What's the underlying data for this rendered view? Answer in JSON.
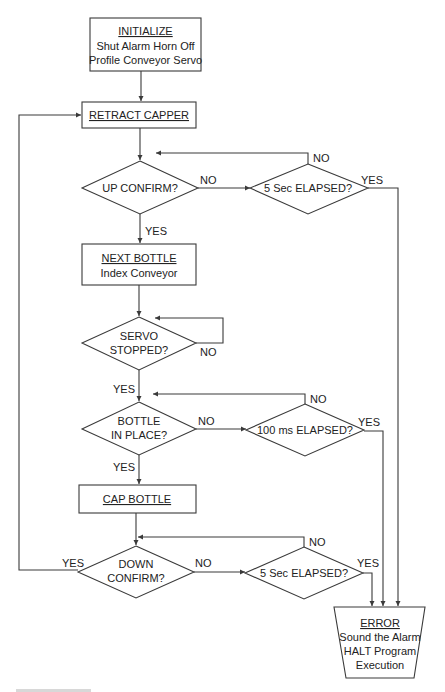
{
  "flowchart": {
    "initialize": {
      "title": "INITIALIZE",
      "lines": [
        "Shut Alarm Horn Off",
        "Profile Conveyor Servo"
      ]
    },
    "retract": {
      "title": "RETRACT CAPPER"
    },
    "up_confirm": {
      "text": "UP CONFIRM?",
      "no": "NO",
      "yes": "YES"
    },
    "up_timeout": {
      "text": "5 Sec ELAPSED?",
      "no": "NO",
      "yes": "YES"
    },
    "next_bottle": {
      "title": "NEXT BOTTLE",
      "lines": [
        "Index Conveyor"
      ]
    },
    "servo": {
      "lines": [
        "SERVO",
        "STOPPED?"
      ],
      "no": "NO",
      "yes": "YES"
    },
    "bottle_in_place": {
      "lines": [
        "BOTTLE",
        "IN PLACE?"
      ],
      "no": "NO",
      "yes": "YES"
    },
    "bottle_timeout": {
      "text": "100 ms ELAPSED?",
      "no": "NO",
      "yes": "YES"
    },
    "cap_bottle": {
      "title": "CAP BOTTLE"
    },
    "down_confirm": {
      "lines": [
        "DOWN",
        "CONFIRM?"
      ],
      "no": "NO",
      "yes": "YES"
    },
    "down_timeout": {
      "text": "5 Sec ELAPSED?",
      "no": "NO",
      "yes": "YES"
    },
    "error": {
      "title": "ERROR",
      "lines": [
        "Sound the Alarm",
        "HALT Program",
        "Execution"
      ]
    }
  }
}
